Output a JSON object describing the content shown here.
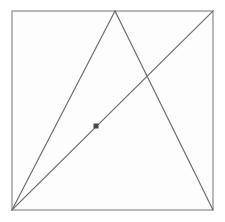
{
  "figure": {
    "width": 225,
    "height": 222,
    "background_color": "#ffffff",
    "plot_background_color": "#fdfdfd",
    "stroke_color": "#8a8a8a",
    "line_color": "#6e6e6e",
    "marker_color": "#4a4a4a",
    "stroke_width": 1.2
  },
  "chart_data": {
    "type": "diagram",
    "xlabel": "",
    "ylabel": "",
    "xlim": [
      0,
      225
    ],
    "ylim": [
      0,
      222
    ],
    "grid": false,
    "legend": "none",
    "points": [
      {
        "name": "top-left-corner",
        "label": "A",
        "x": 12,
        "y": 11,
        "visible_label": ""
      },
      {
        "name": "top-right-corner",
        "label": "B",
        "x": 213,
        "y": 11,
        "visible_label": ""
      },
      {
        "name": "bottom-right-corner",
        "label": "C",
        "x": 213,
        "y": 210,
        "visible_label": ""
      },
      {
        "name": "bottom-left-corner",
        "label": "D",
        "x": 12,
        "y": 210,
        "visible_label": ""
      },
      {
        "name": "triangle-apex",
        "label": "E",
        "x": 115,
        "y": 11,
        "visible_label": ""
      },
      {
        "name": "line-intersection",
        "label": "F",
        "x": 148,
        "y": 78,
        "visible_label": ""
      },
      {
        "name": "marked-point",
        "label": "P",
        "x": 96,
        "y": 126,
        "visible_label": ""
      }
    ],
    "shapes": [
      {
        "name": "bounding-square",
        "kind": "rect",
        "x": 12,
        "y": 11,
        "width": 201,
        "height": 199,
        "fill": "#fdfdfd",
        "stroke": "#8a8a8a"
      }
    ],
    "segments": [
      {
        "name": "triangle-left-side",
        "from": "bottom-left-corner",
        "to": "triangle-apex",
        "x1": 12,
        "y1": 210,
        "x2": 115,
        "y2": 11,
        "stroke": "#6e6e6e"
      },
      {
        "name": "triangle-right-side",
        "from": "triangle-apex",
        "to": "bottom-right-corner",
        "x1": 115,
        "y1": 11,
        "x2": 213,
        "y2": 210,
        "stroke": "#6e6e6e"
      },
      {
        "name": "square-diagonal",
        "from": "bottom-left-corner",
        "to": "top-right-corner",
        "x1": 12,
        "y1": 210,
        "x2": 213,
        "y2": 11,
        "stroke": "#6e6e6e"
      }
    ],
    "markers": [
      {
        "name": "point-marker",
        "shape": "square",
        "x": 96,
        "y": 126,
        "size": 5,
        "fill": "#4a4a4a",
        "lies_on": "square-diagonal"
      }
    ],
    "annotations": []
  }
}
